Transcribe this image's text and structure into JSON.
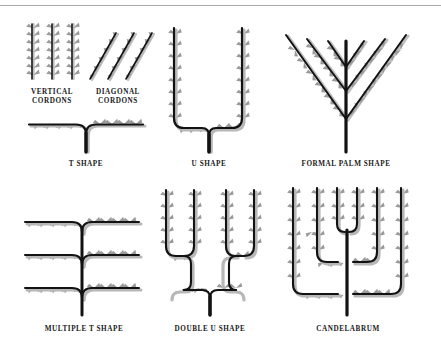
{
  "figure": {
    "background_color": "#ffffff",
    "rule_color": "#a9a9a9",
    "branch_color": "#121212",
    "shadow_color": "#b3b3b3",
    "leaf_color": "#8f8f8f"
  },
  "labels": {
    "vertical_cordons_line1": "VERTICAL",
    "vertical_cordons_line2": "CORDONS",
    "diagonal_cordons_line1": "DIAGONAL",
    "diagonal_cordons_line2": "CORDONS",
    "t_shape": "T SHAPE",
    "u_shape": "U SHAPE",
    "formal_palm_shape": "FORMAL PALM SHAPE",
    "multiple_t_shape": "MULTIPLE T SHAPE",
    "double_u_shape": "DOUBLE U SHAPE",
    "candelabrum": "CANDELABRUM"
  },
  "diagram_data": {
    "type": "diagram",
    "subject": "espalier fruit tree training forms",
    "shape_count": 8,
    "shapes": [
      {
        "name": "vertical-cordons",
        "label": "VERTICAL CORDONS",
        "stems": 3,
        "orientation": "vertical",
        "row": 1,
        "col": 1
      },
      {
        "name": "diagonal-cordons",
        "label": "DIAGONAL CORDONS",
        "stems": 3,
        "orientation": "diagonal",
        "row": 1,
        "col": 1
      },
      {
        "name": "t-shape",
        "label": "T SHAPE",
        "tiers": 1,
        "arms": 2,
        "row": 1,
        "col": 1
      },
      {
        "name": "u-shape",
        "label": "U SHAPE",
        "tiers": 1,
        "verticals": 2,
        "row": 1,
        "col": 2
      },
      {
        "name": "formal-palm-shape",
        "label": "FORMAL PALM SHAPE",
        "branch_pairs": 3,
        "row": 1,
        "col": 3
      },
      {
        "name": "multiple-t-shape",
        "label": "MULTIPLE T SHAPE",
        "tiers": 3,
        "arms": 6,
        "row": 2,
        "col": 1
      },
      {
        "name": "double-u-shape",
        "label": "DOUBLE U SHAPE",
        "verticals": 4,
        "splits": 3,
        "row": 2,
        "col": 2
      },
      {
        "name": "candelabrum",
        "label": "CANDELABRUM",
        "verticals": 6,
        "tiers": 3,
        "row": 2,
        "col": 3
      }
    ]
  }
}
